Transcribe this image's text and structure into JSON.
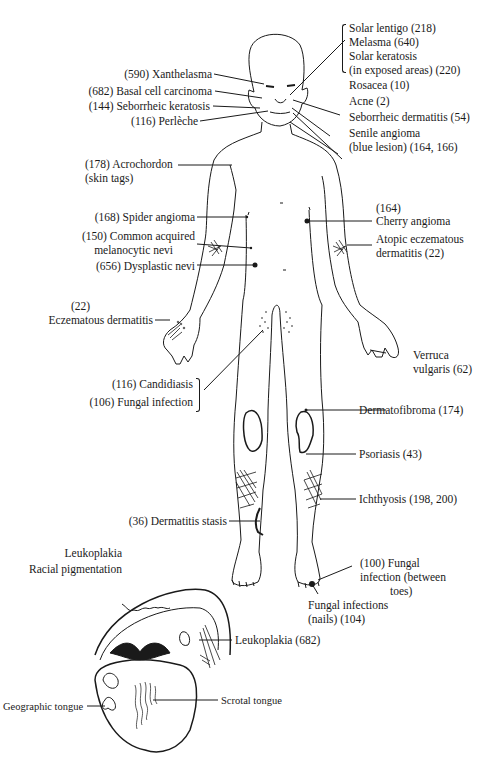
{
  "diagram": {
    "type": "anatomical-lesion-map",
    "face_top_right": {
      "solar_lentigo": "Solar lentigo (218)",
      "melasma": "Melasma (640)",
      "solar_keratosis_1": "Solar keratosis",
      "solar_keratosis_2": "(in exposed areas) (220)",
      "rosacea": "Rosacea (10)",
      "acne": "Acne (2)",
      "seborrheic_dermatitis": "Seborrheic dermatitis (54)",
      "senile_angioma_1": "Senile angioma",
      "senile_angioma_2": "(blue lesion) (164, 166)"
    },
    "face_left": {
      "xanthelasma": "(590) Xanthelasma",
      "basal_cell": "(682) Basal cell carcinoma",
      "seborrheic_keratosis": "(144) Seborrheic keratosis",
      "perleche": "(116) Perlèche"
    },
    "trunk_left": {
      "acrochordon_1": "(178) Acrochordon",
      "acrochordon_2": "(skin tags)",
      "spider_angioma": "(168) Spider angioma",
      "nevi_1": "(150) Common acquired",
      "nevi_2": "melanocytic nevi",
      "dysplastic_nevi": "(656) Dysplastic nevi",
      "eczematous_num": "(22)",
      "eczematous": "Eczematous dermatitis",
      "candidiasis": "(116) Candidiasis",
      "fungal_infection": "(106) Fungal infection",
      "dermatitis_stasis": "(36) Dermatitis stasis"
    },
    "trunk_right": {
      "cherry_num": "(164)",
      "cherry_angioma": "Cherry angioma",
      "atopic_1": "Atopic eczematous",
      "atopic_2": "dermatitis (22)",
      "verruca_1": "Verruca",
      "verruca_2": "vulgaris (62)",
      "dermatofibroma": "Dermatofibroma (174)",
      "psoriasis": "Psoriasis (43)",
      "ichthyosis": "Ichthyosis (198, 200)",
      "fungal_toes_1": "(100) Fungal",
      "fungal_toes_2": "infection (between",
      "fungal_toes_3": "toes)",
      "fungal_nails_1": "Fungal infections",
      "fungal_nails_2": "(nails) (104)"
    },
    "mouth": {
      "leukoplakia_header": "Leukoplakia",
      "racial_pigmentation": "Racial pigmentation",
      "leukoplakia": "Leukoplakia (682)",
      "geographic_tongue": "Geographic tongue",
      "scrotal_tongue": "Scrotal tongue"
    },
    "colors": {
      "ink": "#1a1a1a",
      "background": "#ffffff"
    }
  }
}
